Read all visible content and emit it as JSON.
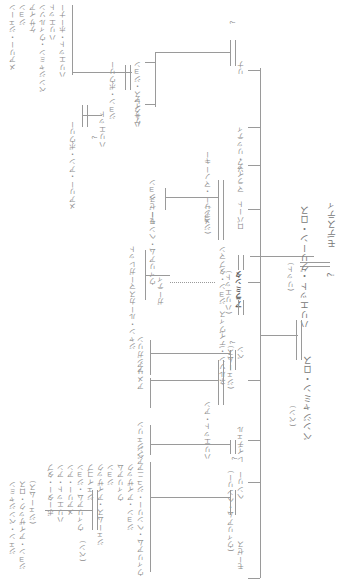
{
  "tree": {
    "root": {
      "father": "モデスティ",
      "mother": "?",
      "child": "ハリエット・グリーン・ロス",
      "child_note": "(リット)",
      "spouse": "ベンジャミン・ロス",
      "spouse_note": "(ベン)"
    },
    "children": [
      {
        "name": "リナ",
        "spouse": "?",
        "children": [
          "ハークレス・ジョン",
          "ケサイア",
          "ジョン・ボウリー",
          "ハリエット",
          "メアリー・アン・ボウリー",
          "?"
        ]
      },
      {
        "name": "マライア・リッティ"
      },
      {
        "name": "ソフ"
      },
      {
        "name": "ロバート",
        "spouse": "メアリー・マノーキー",
        "note": "(ジョン)",
        "children": [
          "ジョン",
          "モーゼス",
          "ウィリアム・ヘンリー"
        ]
      },
      {
        "name": "ミンティ",
        "note": "(ハリエット)",
        "full": "アラミンタ",
        "spouse1": "ジョン・タブマン",
        "spouse2": "ネルソン・デイヴィス",
        "adopted": "ガーティ",
        "adopted_children": [
          "マーガレット",
          "ジャン・ルーカス"
        ]
      },
      {
        "name": "ベン",
        "note": "(ジェームス)",
        "spouse": "?",
        "children": [
          "アンガリン",
          "アメリア"
        ]
      },
      {
        "name": "ヘンリー",
        "note": "(ウィリアム・ヘンリー)",
        "spouse": "ハリエット・アン",
        "children": [
          "?"
        ]
      },
      {
        "name": "レイチェル",
        "spouse": "?",
        "children": [
          "アンジェリン",
          "ベン"
        ]
      },
      {
        "name": "モーゼス"
      }
    ],
    "labels": {
      "grandkids_col": [
        "ハリエット・ホーナー",
        "ハリエット",
        "ベンジャミン・ウィルソン",
        "ケサイア",
        "ジョン",
        "メアリー・ジェーン",
        "ボウリー",
        "ハークレス",
        "ジョン",
        "ゲート"
      ],
      "lower_col": [
        "ウィリアム・ヘンリー・ジュニア",
        "ジョン・アイザック",
        "ウィリアム",
        "ジョン",
        "ジェームス・アイザック",
        "ジェイコブ",
        "ウィリアム・ジョン",
        "メアリー・アン",
        "ハリエット・アン",
        "ポーター・タブ"
      ],
      "bottom_note": [
        "(ジェームス)",
        "ジョン・アイザック・ロス",
        "(ベン)",
        "ジェン・ベンジャミン"
      ]
    }
  }
}
